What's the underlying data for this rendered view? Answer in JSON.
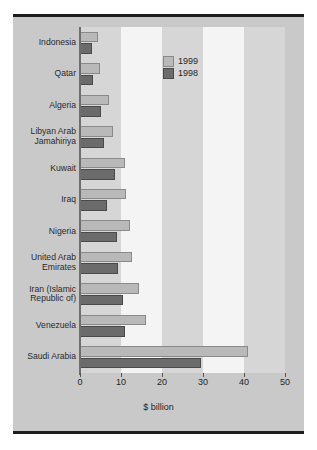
{
  "chart_data": {
    "type": "bar",
    "orientation": "horizontal",
    "title": "",
    "xlabel": "$ billion",
    "ylabel": "",
    "xlim": [
      0,
      50
    ],
    "xticks": [
      0,
      10,
      20,
      30,
      40,
      50
    ],
    "xtick_labels": [
      "0",
      "10",
      "20",
      "30",
      "40",
      "50"
    ],
    "grid": false,
    "bands": "alternating vertical bands every 10 units",
    "legend_position": "upper center",
    "categories": [
      "Indonesia",
      "Qatar",
      "Algeria",
      "Libyan Arab\nJamahiriya",
      "Kuwait",
      "Iraq",
      "Nigeria",
      "United Arab\nEmirates",
      "Iran (Islamic\nRepublic of)",
      "Venezuela",
      "Saudi Arabia"
    ],
    "series": [
      {
        "name": "1999",
        "color": "#b9b9b9",
        "values": [
          4.5,
          4.8,
          7.0,
          8.0,
          11.0,
          11.3,
          12.2,
          12.6,
          14.5,
          16.0,
          41.0
        ]
      },
      {
        "name": "1998",
        "color": "#6b6b6b",
        "values": [
          3.0,
          3.2,
          5.0,
          5.8,
          8.5,
          6.5,
          9.0,
          9.3,
          10.5,
          11.0,
          29.5
        ]
      }
    ]
  },
  "legend": {
    "entries": [
      {
        "label": "1999"
      },
      {
        "label": "1998"
      }
    ]
  },
  "axis": {
    "xlabel": "$ billion"
  }
}
